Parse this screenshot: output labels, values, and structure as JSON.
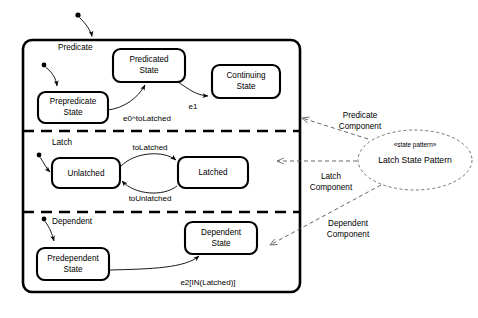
{
  "diagram": {
    "type": "uml-state-diagram"
  },
  "regions": [
    {
      "id": "predicate",
      "label": "Predicate"
    },
    {
      "id": "latch",
      "label": "Latch"
    },
    {
      "id": "dependent",
      "label": "Dependent"
    }
  ],
  "states": {
    "prepredicate": {
      "line1": "Prepredicate",
      "line2": "State"
    },
    "predicated": {
      "line1": "Predicated",
      "line2": "State"
    },
    "continuing": {
      "line1": "Continuing",
      "line2": "State"
    },
    "unlatched": {
      "line1": "Unlatched",
      "line2": ""
    },
    "latched": {
      "line1": "Latched",
      "line2": ""
    },
    "predependent": {
      "line1": "Predependent",
      "line2": "State"
    },
    "dependent": {
      "line1": "Dependent",
      "line2": "State"
    }
  },
  "transitions": {
    "e0_to_latched": "e0^toLatched",
    "e1": "e1",
    "to_latched": "toLatched",
    "to_unlatched": "toUnlatched",
    "e2_in_latched": "e2[IN(Latched)]"
  },
  "annotations": {
    "predicate_component_line1": "Predicate",
    "predicate_component_line2": "Component",
    "latch_component_line1": "Latch",
    "latch_component_line2": "Component",
    "dependent_component_line1": "Dependent",
    "dependent_component_line2": "Component"
  },
  "pattern_note": {
    "stereotype": "«state pattern»",
    "name": "Latch State Pattern"
  },
  "colors": {
    "stroke": "#000000",
    "background": "#ffffff",
    "dashed_accent": "#555555"
  }
}
